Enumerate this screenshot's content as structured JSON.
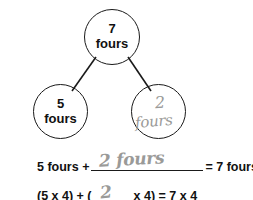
{
  "worksheet": {
    "diagram": {
      "name": "number-bond",
      "nodes": {
        "total": {
          "number": "7",
          "unit": "fours"
        },
        "part_left": {
          "number": "5",
          "unit": "fours"
        },
        "part_right": {
          "number": "2",
          "unit": "fours",
          "handwritten": true
        }
      }
    },
    "equations": {
      "words": {
        "left_term": "5 fours +",
        "blank_answer": "2 fours",
        "right_term": "= 7 fours"
      },
      "numbers": {
        "left_term": "(5 x 4) + (",
        "blank_answer": "2",
        "right_term": "x 4) = 7 x 4"
      }
    },
    "colors": {
      "ink": "#111111",
      "pencil": "#9a9a98",
      "circle_stroke": "#1a1a1a"
    }
  }
}
